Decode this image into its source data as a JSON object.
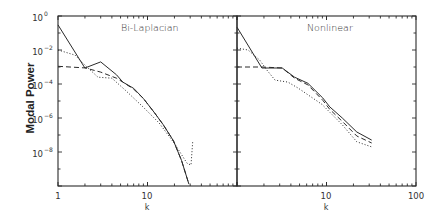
{
  "figure": {
    "ylabel": "Modal Power",
    "xlabel": "k",
    "y_ticks": [
      {
        "base": "10",
        "exp": "0",
        "log": 0
      },
      {
        "base": "10",
        "exp": "−2",
        "log": -2
      },
      {
        "base": "10",
        "exp": "−4",
        "log": -4
      },
      {
        "base": "10",
        "exp": "−6",
        "log": -6
      },
      {
        "base": "10",
        "exp": "−8",
        "log": -8
      }
    ],
    "panels": [
      {
        "title": "Bi-Laplacian",
        "x_tick_labels": [
          {
            "label": "1",
            "k": 1
          },
          {
            "label": "10",
            "k": 10
          }
        ],
        "xlabel": "k"
      },
      {
        "title": "Nonlinear",
        "x_tick_labels": [
          {
            "label": "10",
            "k": 10
          },
          {
            "label": "100",
            "k": 100
          }
        ],
        "xlabel": "k"
      }
    ]
  },
  "chart_data": [
    {
      "type": "line",
      "title": "Bi-Laplacian",
      "xlabel": "k",
      "ylabel": "Modal Power",
      "xscale": "log",
      "yscale": "log",
      "xlim": [
        1,
        100
      ],
      "ylim": [
        1e-10,
        1
      ],
      "grid": false,
      "legend": null,
      "series": [
        {
          "name": "solid",
          "style": "solid",
          "x": [
            1,
            2,
            3,
            4.5,
            5.3,
            7,
            9,
            12,
            15,
            19.5,
            24,
            29
          ],
          "y": [
            0.3,
            0.00087,
            0.002,
            0.00035,
            0.00013,
            5.6e-05,
            1.4e-05,
            2e-06,
            4e-07,
            4.5e-08,
            3.2e-09,
            1.3e-10
          ]
        },
        {
          "name": "dashed",
          "style": "dashed",
          "x": [
            1,
            2,
            3,
            4.5,
            5.3,
            7,
            9,
            12,
            15,
            19.5,
            24,
            29
          ],
          "y": [
            0.0011,
            0.00089,
            0.0005,
            0.00022,
            0.00013,
            5e-05,
            1.4e-05,
            2e-06,
            4e-07,
            4.5e-08,
            3.2e-09,
            1.3e-10
          ]
        },
        {
          "name": "dotted",
          "style": "dotted",
          "x": [
            1,
            1.55,
            2,
            2.8,
            4,
            5.6,
            8.9,
            13.5,
            20,
            27.6,
            30.6,
            32
          ],
          "y": [
            0.01,
            0.005,
            0.0013,
            0.00025,
            0.00022,
            4.5e-05,
            4.5e-06,
            5e-07,
            3.2e-08,
            2.2e-09,
            1.7e-09,
            4e-08
          ]
        }
      ]
    },
    {
      "type": "line",
      "title": "Nonlinear",
      "xlabel": "k",
      "ylabel": "Modal Power",
      "xscale": "log",
      "yscale": "log",
      "xlim": [
        1,
        100
      ],
      "ylim": [
        1e-10,
        1
      ],
      "grid": false,
      "legend": null,
      "series": [
        {
          "name": "solid",
          "style": "solid",
          "x": [
            1,
            1.9,
            3.2,
            4.4,
            6.2,
            9.1,
            10.9,
            15,
            21.8,
            32
          ],
          "y": [
            0.22,
            0.00087,
            0.00087,
            0.00025,
            0.00011,
            1.5e-05,
            4.5e-06,
            1e-06,
            1.5e-07,
            5e-08
          ]
        },
        {
          "name": "dashed",
          "style": "dashed",
          "x": [
            1,
            1.9,
            3.2,
            4.4,
            6.2,
            9.1,
            10.9,
            15,
            21.8,
            32
          ],
          "y": [
            0.001,
            0.001,
            0.00087,
            0.00022,
            8.9e-05,
            1.1e-05,
            3.2e-06,
            6.3e-07,
            8.7e-08,
            3.4e-08
          ]
        },
        {
          "name": "dotted",
          "style": "dotted",
          "x": [
            1,
            1.33,
            1.8,
            2.16,
            2.66,
            3.7,
            4.8,
            8.9,
            15,
            21.8,
            32
          ],
          "y": [
            0.013,
            0.01,
            0.0025,
            0.00066,
            0.00017,
            0.00013,
            5.8e-05,
            6.3e-06,
            4e-07,
            4e-08,
            2e-08
          ]
        }
      ]
    }
  ]
}
